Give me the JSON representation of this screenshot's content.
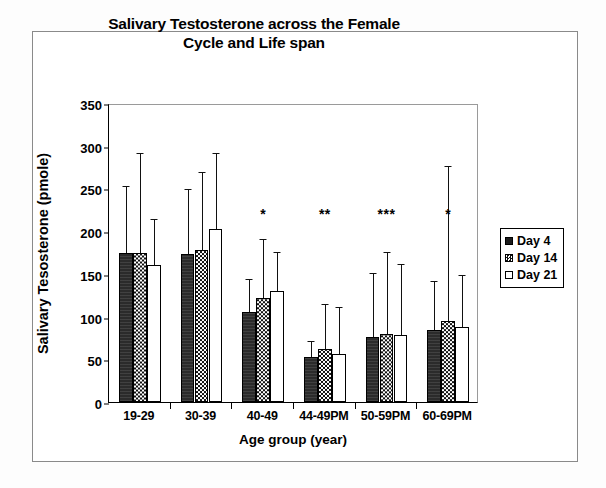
{
  "chart_data": {
    "type": "bar",
    "title": "Salivary Testosterone across the Female Cycle and Life span",
    "title_lines": [
      "Salivary Testosterone across the Female",
      "Cycle and Life span"
    ],
    "xlabel": "Age group (year)",
    "ylabel": "Salivary Tesosterone (pmole)",
    "ylim": [
      0,
      350
    ],
    "ytick_labels": [
      "0",
      "50",
      "100",
      "150",
      "200",
      "250",
      "300",
      "350"
    ],
    "ytick_values": [
      0,
      50,
      100,
      150,
      200,
      250,
      300,
      350
    ],
    "grid": false,
    "legend_position": "right",
    "categories": [
      "19-29",
      "30-39",
      "40-49",
      "44-49PM",
      "50-59PM",
      "60-69PM"
    ],
    "series": [
      {
        "name": "Day 4",
        "fill": "solid-black",
        "values": [
          175,
          173,
          105,
          53,
          76,
          84
        ],
        "errors_upper": [
          252,
          248,
          143,
          70,
          150,
          141
        ]
      },
      {
        "name": "Day 14",
        "fill": "checkered",
        "values": [
          175,
          178,
          122,
          62,
          80,
          95
        ],
        "errors_upper": [
          290,
          268,
          190,
          113,
          175,
          275
        ]
      },
      {
        "name": "Day 21",
        "fill": "white",
        "values": [
          160,
          203,
          130,
          56,
          79,
          88
        ],
        "errors_upper": [
          213,
          290,
          175,
          110,
          160,
          147
        ]
      }
    ],
    "annotations": [
      {
        "category": "40-49",
        "text": "*",
        "value": 212
      },
      {
        "category": "44-49PM",
        "text": "**",
        "value": 212
      },
      {
        "category": "50-59PM",
        "text": "***",
        "value": 212
      },
      {
        "category": "60-69PM",
        "text": "*",
        "value": 212
      }
    ],
    "colors": {
      "day4": "#1c1c1c",
      "day14": "#111111",
      "day21": "#ffffff",
      "axis": "#000000",
      "frame": "#8a8a8a"
    }
  }
}
